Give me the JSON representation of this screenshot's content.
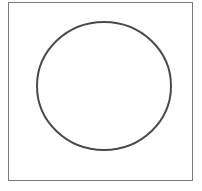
{
  "diagram": {
    "frame": {
      "x": 8.5,
      "y": 2.5,
      "width": 184,
      "height": 178,
      "stroke": "#7a7a7a",
      "stroke_width": 1
    },
    "circle": {
      "cx": 104,
      "cy": 86,
      "rx": 67,
      "ry": 64,
      "stroke": "#4a4a4a",
      "stroke_width": 2,
      "fill": "none"
    }
  }
}
